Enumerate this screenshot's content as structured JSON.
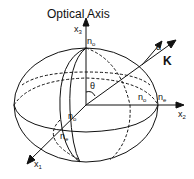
{
  "diagram": {
    "title": "Optical Axis",
    "axes": {
      "x1": {
        "base": "x",
        "sub": "1"
      },
      "x2": {
        "base": "x",
        "sub": "2"
      },
      "x3": {
        "base": "x",
        "sub": "3"
      }
    },
    "labels": {
      "no_top": {
        "base": "n",
        "sub": "o"
      },
      "no_right": {
        "base": "n",
        "sub": "o"
      },
      "ne_right": {
        "base": "n",
        "sub": "e"
      },
      "no_front": {
        "base": "n",
        "sub": "o"
      },
      "ne_front": {
        "base": "n",
        "sub": "e"
      },
      "theta": "θ",
      "alpha": "α",
      "k": "K"
    }
  }
}
